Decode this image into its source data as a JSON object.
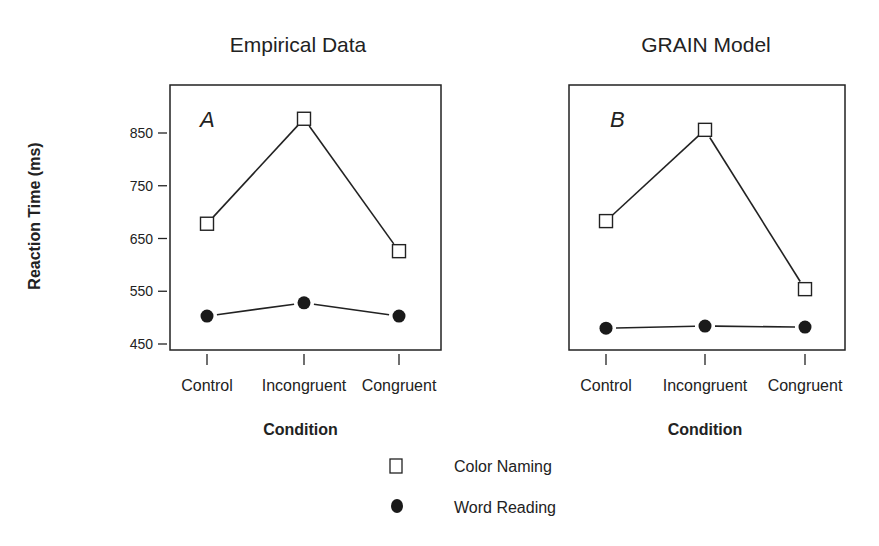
{
  "ylabel": "Reaction Time (ms)",
  "legend": [
    {
      "label": "Color Naming",
      "marker": "open-square"
    },
    {
      "label": "Word Reading",
      "marker": "filled-circle"
    }
  ],
  "chart_data": [
    {
      "type": "line",
      "title": "Empirical Data",
      "panel_label": "A",
      "categories": [
        "Control",
        "Incongruent",
        "Congruent"
      ],
      "xlabel": "Condition",
      "ylabel": "Reaction Time (ms)",
      "yticks": [
        450,
        550,
        650,
        750,
        850
      ],
      "ylim": [
        430,
        920
      ],
      "series": [
        {
          "name": "Color Naming",
          "marker": "open-square",
          "values": [
            678,
            877,
            626
          ]
        },
        {
          "name": "Word Reading",
          "marker": "filled-circle",
          "values": [
            503,
            528,
            503
          ]
        }
      ],
      "legend_position": "bottom-center",
      "grid": false
    },
    {
      "type": "line",
      "title": "GRAIN Model",
      "panel_label": "B",
      "categories": [
        "Control",
        "Incongruent",
        "Congruent"
      ],
      "xlabel": "Condition",
      "ylabel": "",
      "yticks": [],
      "ylim": [
        430,
        920
      ],
      "series": [
        {
          "name": "Color Naming",
          "marker": "open-square",
          "values": [
            683,
            856,
            554
          ]
        },
        {
          "name": "Word Reading",
          "marker": "filled-circle",
          "values": [
            480,
            484,
            482
          ]
        }
      ],
      "legend_position": "bottom-center",
      "grid": false
    }
  ]
}
